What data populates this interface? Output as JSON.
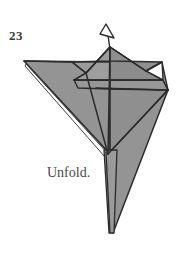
{
  "figure": {
    "step_number": "23",
    "caption": "Unfold.",
    "arrow": {
      "name": "unfold-arrow",
      "direction": "up",
      "style": "hollow-outline-arrowhead"
    }
  },
  "colors": {
    "paper_fill": "#949494",
    "paper_fill_shadow": "#8a8a8a",
    "paper_fill_light": "#9c9c9c",
    "outline": "#2b2b2b",
    "crease_line": "#2b2b2b",
    "background": "#ffffff",
    "text": "#3a3a3a",
    "caption_text": "#4a4a4a"
  },
  "geometry": {
    "canvas": {
      "width": 185,
      "height": 259
    },
    "apex": {
      "x": 110,
      "y": 47
    },
    "left_wing_tip": {
      "x": 24,
      "y": 61
    },
    "right_wing_tip": {
      "x": 168,
      "y": 89
    },
    "center_junction": {
      "x": 108,
      "y": 153
    },
    "bottom_tip": {
      "x": 113,
      "y": 233
    },
    "left_notch": {
      "x": 86,
      "y": 73
    },
    "right_notch": {
      "x": 146,
      "y": 71
    },
    "horizontal_crease_upper_y": 80,
    "horizontal_crease_lower_y": 88
  },
  "shapes": [
    {
      "name": "left-wing-panel",
      "points": "24,61 108,62 108,153",
      "fill_key": "paper_fill"
    },
    {
      "name": "left-wing-under-sliver",
      "points": "24,62 108,154 104,156",
      "fill_key": "background"
    },
    {
      "name": "upper-peak-left-face",
      "points": "110,47 86,73 74,62 110,62",
      "fill_key": "paper_fill_light"
    },
    {
      "name": "upper-peak-right-face",
      "points": "110,47 146,71 160,62 110,62",
      "fill_key": "paper_fill"
    },
    {
      "name": "peak-valley-left",
      "points": "86,73 110,62 110,80 74,80",
      "fill_key": "paper_fill"
    },
    {
      "name": "peak-valley-right",
      "points": "146,71 110,62 110,80 163,80",
      "fill_key": "paper_fill"
    },
    {
      "name": "right-lower-panel",
      "points": "108,88 168,89 108,153",
      "fill_key": "paper_fill"
    },
    {
      "name": "right-outer-panel",
      "points": "168,89 152,160 113,233 108,153",
      "fill_key": "paper_fill"
    },
    {
      "name": "bottom-tail",
      "points": "103,153 117,153 113,233 108,233",
      "fill_key": "paper_fill"
    }
  ],
  "creases": [
    {
      "name": "crease-apex-to-center",
      "from": [
        110,
        47
      ],
      "to": [
        108,
        153
      ]
    },
    {
      "name": "crease-horizontal-upper",
      "from": [
        74,
        80
      ],
      "to": [
        163,
        80
      ]
    },
    {
      "name": "crease-horizontal-lower",
      "from": [
        96,
        88
      ],
      "to": [
        168,
        89
      ]
    },
    {
      "name": "crease-left-notch-diagonal",
      "from": [
        86,
        73
      ],
      "to": [
        108,
        153
      ]
    },
    {
      "name": "crease-right-wing-diagonal",
      "from": [
        168,
        89
      ],
      "to": [
        108,
        153
      ]
    }
  ]
}
